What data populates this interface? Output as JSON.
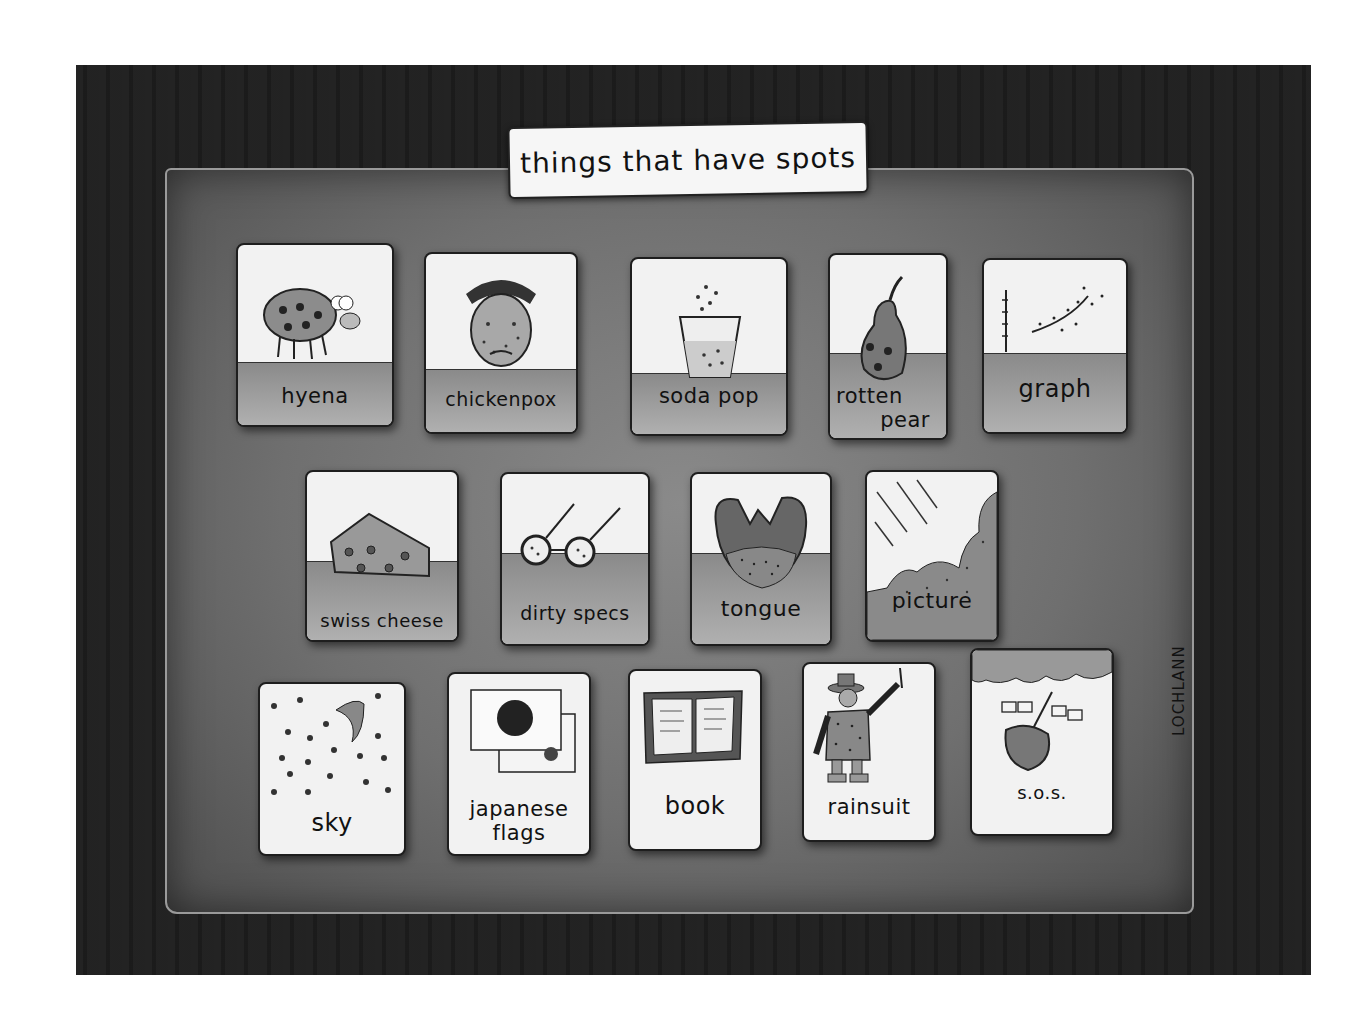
{
  "title": "things that have spots",
  "signature": "LOCHLANN",
  "colors": {
    "frame": "#1f1f1f",
    "board": "#777777",
    "card": "#f2f2f2",
    "ink": "#111111"
  },
  "rows": [
    {
      "cards": [
        {
          "label": "hyena",
          "icon": "hyena-icon"
        },
        {
          "label": "chickenpox",
          "icon": "sick-face-icon"
        },
        {
          "label": "soda pop",
          "icon": "soda-glass-icon"
        },
        {
          "label": "rotten pear",
          "label_line1": "rotten",
          "label_line2": "pear",
          "icon": "pear-icon"
        },
        {
          "label": "graph",
          "icon": "scatter-graph-icon"
        }
      ]
    },
    {
      "cards": [
        {
          "label": "swiss cheese",
          "icon": "cheese-icon"
        },
        {
          "label": "dirty specs",
          "icon": "glasses-icon"
        },
        {
          "label": "tongue",
          "icon": "tongue-icon"
        },
        {
          "label": "picture",
          "icon": "dotted-picture-icon"
        }
      ]
    },
    {
      "cards": [
        {
          "label": "sky",
          "icon": "night-sky-icon"
        },
        {
          "label": "japanese flags",
          "label_line1": "japanese",
          "label_line2": "flags",
          "icon": "japanese-flag-icon"
        },
        {
          "label": "book",
          "icon": "open-book-icon"
        },
        {
          "label": "rainsuit",
          "icon": "man-in-rainsuit-icon"
        },
        {
          "label": "s.o.s.",
          "icon": "sinking-boat-flags-icon"
        }
      ]
    }
  ]
}
